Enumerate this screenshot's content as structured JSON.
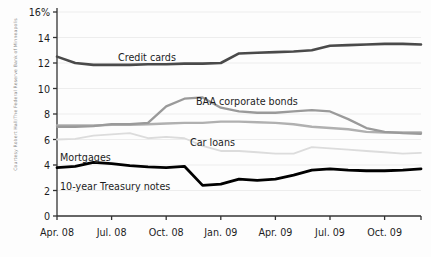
{
  "credit": "Courtesy Robert Hall/The Federal Reserve Bank of Minneapolis",
  "axis": {
    "y_ticks": [
      "16%",
      "14",
      "12",
      "10",
      "8",
      "6",
      "4",
      "2",
      "0"
    ],
    "x_ticks": [
      "Apr. 08",
      "Jul. 08",
      "Oct. 08",
      "Jan. 09",
      "Apr. 09",
      "Jul. 09",
      "Oct. 09"
    ]
  },
  "labels": {
    "credit_cards": "Credit cards",
    "baa": "BAA corporate bonds",
    "car_loans": "Car loans",
    "mortgages": "Mortgages",
    "treasury": "10-year Treasury notes"
  },
  "colors": {
    "credit_cards": "#4a4a4a",
    "baa": "#9a9a9a",
    "car_loans": "#b0b0b0",
    "mortgages": "#dcdcdc",
    "treasury": "#000000",
    "axis": "#333333",
    "grid": "#ededed",
    "text": "#1d1d1d",
    "credit_text": "#8a8a8a"
  },
  "chart_data": {
    "type": "line",
    "title": "",
    "xlabel": "",
    "ylabel": "",
    "ylim": [
      0,
      16
    ],
    "yticks": [
      0,
      2,
      4,
      6,
      8,
      10,
      12,
      14,
      16
    ],
    "grid": true,
    "legend": "inline-labels",
    "x": [
      "Apr. 08",
      "May 08",
      "Jun. 08",
      "Jul. 08",
      "Aug. 08",
      "Sep. 08",
      "Oct. 08",
      "Nov. 08",
      "Dec. 08",
      "Jan. 09",
      "Feb. 09",
      "Mar. 09",
      "Apr. 09",
      "May 09",
      "Jun. 09",
      "Jul. 09",
      "Aug. 09",
      "Sep. 09",
      "Oct. 09",
      "Nov. 09",
      "Dec. 09"
    ],
    "series": [
      {
        "name": "Credit cards",
        "color": "#4a4a4a",
        "values": [
          12.5,
          12.0,
          11.85,
          11.85,
          11.85,
          11.9,
          11.9,
          11.95,
          11.95,
          12.0,
          12.75,
          12.8,
          12.85,
          12.9,
          13.0,
          13.35,
          13.4,
          13.45,
          13.5,
          13.5,
          13.45
        ]
      },
      {
        "name": "BAA corporate bonds",
        "color": "#9a9a9a",
        "values": [
          7.0,
          7.0,
          7.05,
          7.2,
          7.2,
          7.3,
          8.6,
          9.2,
          9.3,
          8.5,
          8.2,
          8.1,
          8.1,
          8.2,
          8.3,
          8.2,
          7.6,
          6.9,
          6.6,
          6.5,
          6.45
        ]
      },
      {
        "name": "Car loans",
        "color": "#b0b0b0",
        "values": [
          7.1,
          7.1,
          7.1,
          7.15,
          7.15,
          7.2,
          7.25,
          7.3,
          7.3,
          7.4,
          7.4,
          7.35,
          7.3,
          7.2,
          7.0,
          6.9,
          6.8,
          6.6,
          6.55,
          6.55,
          6.55
        ]
      },
      {
        "name": "Mortgages",
        "color": "#dcdcdc",
        "values": [
          6.0,
          6.05,
          6.3,
          6.4,
          6.5,
          6.1,
          6.2,
          6.1,
          5.5,
          5.1,
          5.1,
          5.0,
          4.9,
          4.9,
          5.4,
          5.3,
          5.2,
          5.1,
          5.0,
          4.9,
          4.95
        ]
      },
      {
        "name": "10-year Treasury notes",
        "color": "#000000",
        "values": [
          3.8,
          3.9,
          4.2,
          4.1,
          3.95,
          3.85,
          3.8,
          3.9,
          2.4,
          2.5,
          2.9,
          2.8,
          2.9,
          3.2,
          3.6,
          3.7,
          3.6,
          3.55,
          3.55,
          3.6,
          3.7
        ]
      }
    ]
  }
}
